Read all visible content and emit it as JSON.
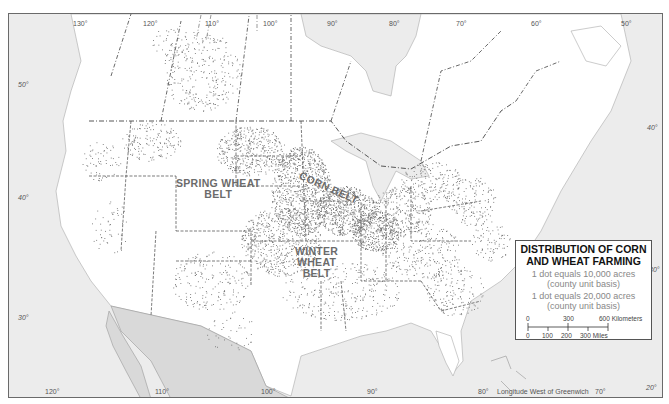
{
  "map": {
    "type": "dot_distribution",
    "subject": "North America",
    "colors": {
      "land": "#ffffff",
      "water": "#ececec",
      "mexico": "#d9d9d9",
      "dots": "#6e6e6e",
      "boundaries": "#444444",
      "region_labels": "#6b6b6b"
    },
    "longitude_labels_top": [
      "130°",
      "120°",
      "110°",
      "100°",
      "90°",
      "80°",
      "70°",
      "60°",
      "50°"
    ],
    "longitude_labels_bottom": [
      "120°",
      "110°",
      "100°",
      "90°",
      "80°",
      "70°",
      "20°"
    ],
    "latitude_labels_left": [
      "50°",
      "40°",
      "30°"
    ],
    "latitude_labels_right": [
      "40°",
      "30°"
    ],
    "longitude_caption": "Longitude West of Greenwich",
    "region_labels": {
      "spring_wheat": [
        "SPRING WHEAT",
        "BELT"
      ],
      "corn_belt": "CORN BELT",
      "winter_wheat": [
        "WINTER",
        "WHEAT",
        "BELT"
      ]
    }
  },
  "legend": {
    "title_line1": "DISTRIBUTION OF CORN",
    "title_line2": "AND WHEAT FARMING",
    "item1_line1": "1 dot equals 10,000 acres",
    "item1_line2": "(county unit basis)",
    "item2_line1": "1 dot equals 20,000 acres",
    "item2_line2": "(county unit basis)",
    "scale": {
      "km_ticks": [
        "0",
        "300",
        "600 Kilometers"
      ],
      "mile_ticks": [
        "0",
        "100",
        "200",
        "300 Miles"
      ]
    }
  }
}
